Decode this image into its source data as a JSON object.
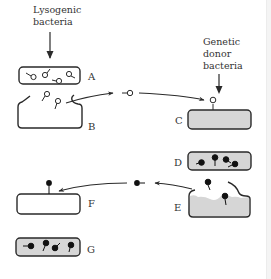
{
  "diagram": {
    "title_top_left": [
      "Lysogenic",
      "bacteria"
    ],
    "title_top_right": [
      "Genetic",
      "donor",
      "bacteria"
    ],
    "panel_labels": {
      "A": "A",
      "B": "B",
      "C": "C",
      "D": "D",
      "E": "E",
      "F": "F",
      "G": "G"
    },
    "colors": {
      "stroke": "#2a2a2a",
      "cell_fill_gray": "#d6d6d6",
      "cell_fill_white": "#ffffff",
      "phage_head_empty": "#ffffff",
      "phage_head_filled": "#111111",
      "text": "#333333"
    },
    "stages": [
      {
        "id": "A",
        "description": "Lysogenic bacterium containing prophages (empty heads)"
      },
      {
        "id": "B",
        "description": "Lysed bacterium releasing empty-headed phages"
      },
      {
        "id": "C",
        "description": "Phage attaches to genetic donor bacterium (gray)"
      },
      {
        "id": "D",
        "description": "Donor bacterium with phages carrying donor DNA (filled heads)"
      },
      {
        "id": "E",
        "description": "Donor bacterium lyses, releasing transducing phages"
      },
      {
        "id": "F",
        "description": "Transducing phage attaches to recipient bacterium"
      },
      {
        "id": "G",
        "description": "Recipient bacterium with phages carrying donor genes"
      }
    ]
  }
}
